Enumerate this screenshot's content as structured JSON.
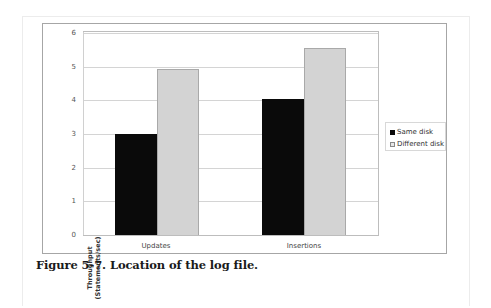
{
  "figure": {
    "caption": "Figure 5-7. Location of the log file."
  },
  "chart_data": {
    "type": "bar",
    "title": "",
    "xlabel": "",
    "ylabel": "Throughput (Statements/sec)",
    "ylabel_lines": [
      "Throughput",
      "(Statements/sec)"
    ],
    "categories": [
      "Updates",
      "Insertions"
    ],
    "series": [
      {
        "name": "Same disk",
        "color": "#0a0a0a",
        "values": [
          3.0,
          4.05
        ]
      },
      {
        "name": "Different disk",
        "color": "#d3d3d3",
        "values": [
          4.93,
          5.55
        ]
      }
    ],
    "ylim": [
      0,
      6
    ],
    "yticks": [
      "0",
      "1",
      "2",
      "3",
      "4",
      "5",
      "6"
    ],
    "grid": true,
    "legend_position": "right"
  }
}
